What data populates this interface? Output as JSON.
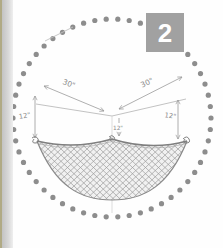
{
  "badge": {
    "number": "2",
    "bg_color": "#a1a1a1",
    "text_color": "#ffffff"
  },
  "diagram": {
    "labels": {
      "left_span": "30\"",
      "right_span": "30\"",
      "left_drop": "12\"",
      "center_drop": "12\"",
      "right_drop": "12\""
    },
    "colors": {
      "dots": "#8d8d8d",
      "sketch": "#9a9a9a",
      "hammock": "#8f8f8f",
      "page_edge": "#b0aa85",
      "gutter": "#cccccc"
    },
    "dot_count": 54
  }
}
